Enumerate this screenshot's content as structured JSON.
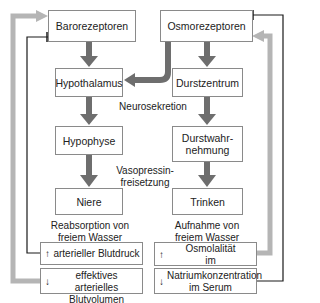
{
  "diagram": {
    "nodes": {
      "barorezeptoren": "Barorezeptoren",
      "osmorezeptoren": "Osmorezeptoren",
      "hypothalamus": "Hypothalamus",
      "durstzentrum": "Durstzentrum",
      "hypophyse": "Hypophyse",
      "durstwahrnehmung_1": "Durstwahr-",
      "durstwahrnehmung_2": "nehmung",
      "niere": "Niere",
      "trinken": "Trinken"
    },
    "edge_labels": {
      "neurosekretion": "Neurosekretion",
      "vasopressin_1": "Vasopressin-",
      "vasopressin_2": "freisetzung",
      "reabsorption_1": "Reabsorption von",
      "reabsorption_2": "freiem Wasser",
      "aufnahme_1": "Aufnahme von",
      "aufnahme_2": "freiem Wasser"
    },
    "outcomes": {
      "blutdruck": {
        "arrow": "↑",
        "text": "arterieller Blutdruck"
      },
      "blutvolumen": {
        "arrow": "↓",
        "text_1": "effektives arterielles",
        "text_2": "Blutvolumen"
      },
      "osmolalitaet": {
        "arrow": "↑",
        "text_1": "Osmolalität",
        "text_2": "im Extrazellularraum"
      },
      "natrium": {
        "arrow": "↓",
        "text_1": "Natriumkonzentration",
        "text_2": "im Serum"
      }
    },
    "colors": {
      "dark_arrow": "#6e6e6e",
      "light_arrow": "#b5b5b5",
      "line": "#1a1a1a",
      "border": "#8a8a8a"
    }
  }
}
